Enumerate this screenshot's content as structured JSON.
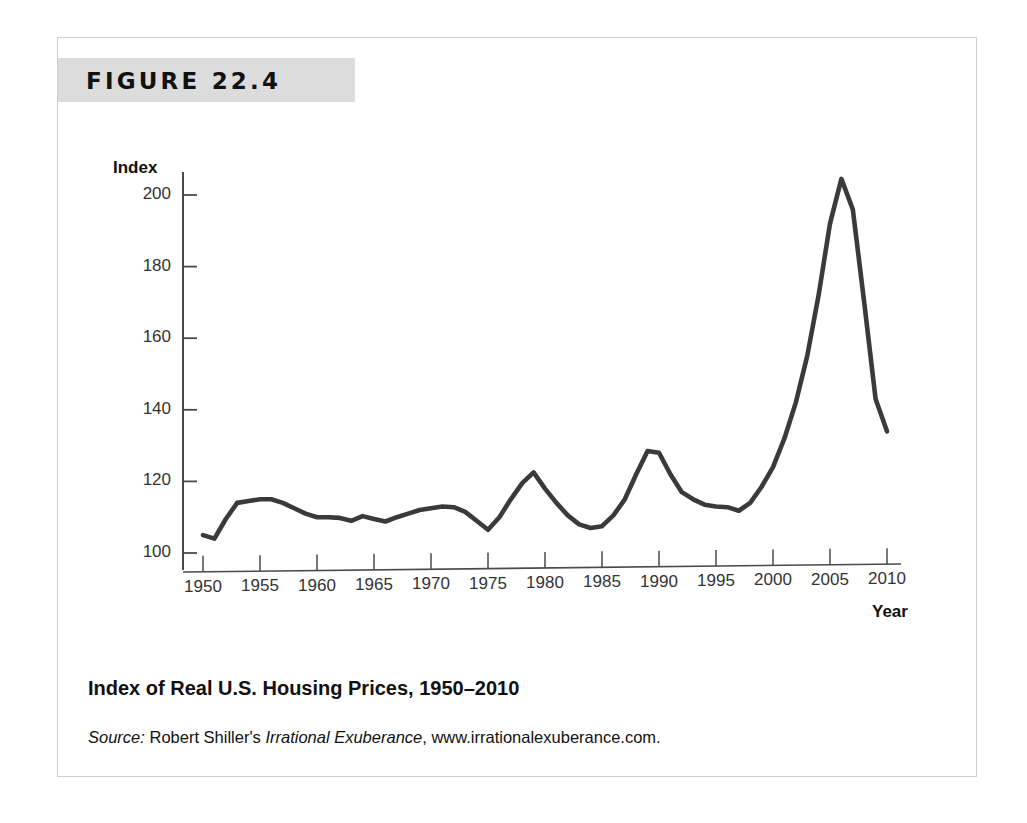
{
  "figure": {
    "label": "FIGURE 22.4",
    "title": "Index of Real U.S. Housing Prices, 1950–2010",
    "source_prefix": "Source:",
    "source_author": " Robert Shiller's ",
    "source_work": "Irrational Exuberance",
    "source_url": ", www.irrationalexuberance.com."
  },
  "colors": {
    "line": "#3a3a3a",
    "axis": "#4a4a4a",
    "band": "#dcdcdc",
    "frame": "#cfcfcf",
    "text": "#111111",
    "tick_text": "#333333"
  },
  "chart_data": {
    "type": "line",
    "title": "Index of Real U.S. Housing Prices, 1950–2010",
    "xlabel": "Year",
    "ylabel": "Index",
    "xlim": [
      1949,
      2010.5
    ],
    "ylim": [
      96,
      208
    ],
    "xticks": [
      1950,
      1955,
      1960,
      1965,
      1970,
      1975,
      1980,
      1985,
      1990,
      1995,
      2000,
      2005,
      2010
    ],
    "yticks": [
      100,
      120,
      140,
      160,
      180,
      200
    ],
    "grid": false,
    "legend": null,
    "series": [
      {
        "name": "Real U.S. Housing Price Index",
        "x": [
          1950,
          1951,
          1952,
          1953,
          1954,
          1955,
          1956,
          1957,
          1958,
          1959,
          1960,
          1961,
          1962,
          1963,
          1964,
          1965,
          1966,
          1967,
          1968,
          1969,
          1970,
          1971,
          1972,
          1973,
          1974,
          1975,
          1976,
          1977,
          1978,
          1979,
          1980,
          1981,
          1982,
          1983,
          1984,
          1985,
          1986,
          1987,
          1988,
          1989,
          1990,
          1991,
          1992,
          1993,
          1994,
          1995,
          1996,
          1997,
          1998,
          1999,
          2000,
          2001,
          2002,
          2003,
          2004,
          2005,
          2006,
          2007,
          2008,
          2009,
          2010
        ],
        "values": [
          105.0,
          104.0,
          109.5,
          114.0,
          114.5,
          115.0,
          115.0,
          114.0,
          112.5,
          111.0,
          110.0,
          110.0,
          109.8,
          109.0,
          110.3,
          109.5,
          108.8,
          110.0,
          111.0,
          112.0,
          112.5,
          113.0,
          112.8,
          111.5,
          109.0,
          106.5,
          110.0,
          115.0,
          119.5,
          122.5,
          118.0,
          114.0,
          110.5,
          108.0,
          107.0,
          107.5,
          110.5,
          115.0,
          122.0,
          128.5,
          128.0,
          122.0,
          117.0,
          115.0,
          113.5,
          113.0,
          112.8,
          111.8,
          114.0,
          118.5,
          124.0,
          132.0,
          142.0,
          155.0,
          172.0,
          192.0,
          204.5,
          196.0,
          170.0,
          143.0,
          134.0
        ]
      }
    ],
    "annotations": []
  }
}
